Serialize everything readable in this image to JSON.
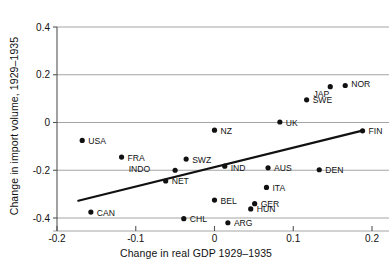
{
  "chart_data": {
    "type": "scatter",
    "title": "",
    "xlabel": "Change in real GDP 1929–1935",
    "ylabel": "Change in import volume, 1929–1935",
    "xlim": [
      -0.2,
      0.2
    ],
    "ylim": [
      -0.4,
      0.4
    ],
    "xticks": [
      -0.2,
      -0.1,
      0,
      0.1,
      0.2
    ],
    "xticklabels": [
      "-0.2",
      "-0.1",
      "0",
      "0.1",
      "0.2"
    ],
    "yticks": [
      -0.4,
      -0.2,
      0,
      0.2,
      0.4
    ],
    "yticklabels": [
      "-0.4",
      "-0.2",
      "0",
      "0.2",
      "0.4"
    ],
    "grid": true,
    "grid_axis": "y",
    "legend": "none",
    "marker_color": "#111111",
    "line_color": "#111111",
    "grid_color": "#9a9a9a",
    "axis_color": "#555555",
    "points": [
      {
        "label": "USA",
        "x": -0.168,
        "y": -0.075,
        "label_dx": 6,
        "label_dy": 3.5
      },
      {
        "label": "CAN",
        "x": -0.157,
        "y": -0.375,
        "label_dx": 6,
        "label_dy": 3.5
      },
      {
        "label": "FRA",
        "x": -0.118,
        "y": -0.145,
        "label_dx": 6,
        "label_dy": 3.5
      },
      {
        "label": "NET",
        "x": -0.062,
        "y": -0.245,
        "label_dx": 6,
        "label_dy": 3.5
      },
      {
        "label": "INDO",
        "x": -0.05,
        "y": -0.2,
        "label_dx": -25,
        "label_dy": 1.5
      },
      {
        "label": "CHL",
        "x": -0.039,
        "y": -0.403,
        "label_dx": 6,
        "label_dy": 3.5
      },
      {
        "label": "SWZ",
        "x": -0.036,
        "y": -0.153,
        "label_dx": 6,
        "label_dy": 3.5
      },
      {
        "label": "NZ",
        "x": 0.0,
        "y": -0.032,
        "label_dx": 6,
        "label_dy": 3.5
      },
      {
        "label": "BEL",
        "x": 0.0,
        "y": -0.325,
        "label_dx": 6,
        "label_dy": 3.5
      },
      {
        "label": "ARG",
        "x": 0.017,
        "y": -0.42,
        "label_dx": 6,
        "label_dy": 3.5
      },
      {
        "label": "IND",
        "x": 0.013,
        "y": -0.183,
        "label_dx": 6,
        "label_dy": 4.5
      },
      {
        "label": "HUN",
        "x": 0.046,
        "y": -0.362,
        "label_dx": 6,
        "label_dy": 3.5
      },
      {
        "label": "GER",
        "x": 0.051,
        "y": -0.34,
        "label_dx": 6,
        "label_dy": 3.0
      },
      {
        "label": "ITA",
        "x": 0.066,
        "y": -0.272,
        "label_dx": 6,
        "label_dy": 3.5
      },
      {
        "label": "AUS",
        "x": 0.068,
        "y": -0.19,
        "label_dx": 6,
        "label_dy": 3.5
      },
      {
        "label": "UK",
        "x": 0.083,
        "y": 0.002,
        "label_dx": 6,
        "label_dy": 3.5
      },
      {
        "label": "SWE",
        "x": 0.117,
        "y": 0.095,
        "label_dx": 6,
        "label_dy": 3.5
      },
      {
        "label": "DEN",
        "x": 0.133,
        "y": -0.198,
        "label_dx": 6,
        "label_dy": 3.5
      },
      {
        "label": "JAP",
        "x": 0.147,
        "y": 0.15,
        "label_dx": -1,
        "label_dy": 10
      },
      {
        "label": "NOR",
        "x": 0.166,
        "y": 0.155,
        "label_dx": 6,
        "label_dy": 2.0
      },
      {
        "label": "FIN",
        "x": 0.188,
        "y": -0.035,
        "label_dx": 6,
        "label_dy": 3.5
      }
    ],
    "trendline": {
      "x0": -0.173,
      "y0": -0.328,
      "x1": 0.189,
      "y1": -0.033
    }
  }
}
